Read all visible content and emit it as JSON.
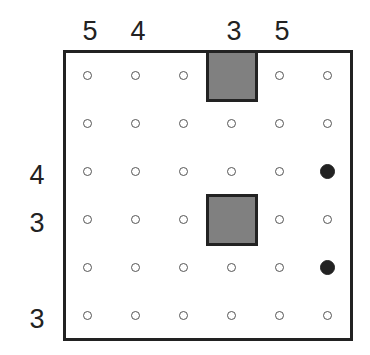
{
  "puzzle": {
    "rows": 6,
    "cols": 6,
    "top_clues": [
      "5",
      "4",
      "",
      "3",
      "5",
      ""
    ],
    "left_clues": [
      "",
      "",
      "4",
      "3",
      "",
      "3"
    ],
    "blocks": [
      [
        0,
        3
      ],
      [
        3,
        3
      ]
    ],
    "black_dots": [
      [
        2,
        5
      ],
      [
        4,
        5
      ]
    ]
  }
}
